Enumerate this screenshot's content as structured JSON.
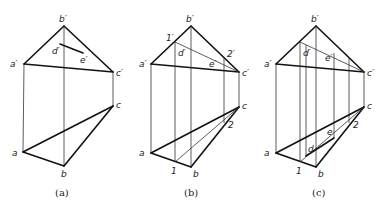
{
  "panels": [
    {
      "caption": "(a)",
      "labels": {
        "b_prime": "b′",
        "a_prime": "a′",
        "c_prime": "c′",
        "d_prime": "d′",
        "e_prime": "e′",
        "a": "a",
        "b": "b",
        "c": "c"
      }
    },
    {
      "caption": "(b)",
      "labels": {
        "b_prime": "b′",
        "a_prime": "a′",
        "c_prime": "c′",
        "d_prime": "d′",
        "e_prime": "e′",
        "one_prime": "1′",
        "two_prime": "2′",
        "a": "a",
        "b": "b",
        "c": "c",
        "one": "1",
        "two": "2"
      }
    },
    {
      "caption": "(c)",
      "labels": {
        "b_prime": "b′",
        "a_prime": "a′",
        "c_prime": "c′",
        "d_prime": "d′",
        "e_prime": "e′",
        "a": "a",
        "b": "b",
        "c": "c",
        "d": "d",
        "e": "e",
        "one": "1",
        "two": "2"
      }
    }
  ]
}
